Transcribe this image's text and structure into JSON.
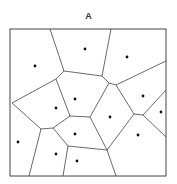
{
  "diagram": {
    "title": "A",
    "type": "voronoi",
    "frame": {
      "x": 10,
      "y": 29,
      "width": 156,
      "height": 147
    },
    "sites": [
      [
        35,
        66
      ],
      [
        85,
        49
      ],
      [
        127,
        57
      ],
      [
        75,
        99
      ],
      [
        56,
        108
      ],
      [
        143,
        96
      ],
      [
        161,
        112
      ],
      [
        110,
        117
      ],
      [
        75,
        134
      ],
      [
        138,
        135
      ],
      [
        18,
        142
      ],
      [
        56,
        154
      ],
      [
        77,
        161
      ]
    ],
    "edges": [
      [
        50,
        29,
        64,
        71
      ],
      [
        111,
        29,
        102,
        76
      ],
      [
        64,
        71,
        102,
        76
      ],
      [
        102,
        76,
        109,
        83
      ],
      [
        109,
        83,
        116,
        85
      ],
      [
        116,
        85,
        166,
        61
      ],
      [
        64,
        71,
        56,
        79
      ],
      [
        56,
        79,
        12,
        103
      ],
      [
        56,
        79,
        70,
        116
      ],
      [
        109,
        83,
        90,
        117
      ],
      [
        70,
        116,
        90,
        117
      ],
      [
        116,
        85,
        134,
        114
      ],
      [
        134,
        114,
        143,
        115
      ],
      [
        143,
        115,
        166,
        90
      ],
      [
        143,
        115,
        166,
        137
      ],
      [
        134,
        114,
        107,
        150
      ],
      [
        90,
        117,
        107,
        150
      ],
      [
        12,
        103,
        41,
        129
      ],
      [
        41,
        129,
        53,
        128
      ],
      [
        53,
        128,
        70,
        116
      ],
      [
        53,
        128,
        68,
        146
      ],
      [
        68,
        146,
        107,
        150
      ],
      [
        41,
        129,
        29,
        176
      ],
      [
        68,
        146,
        63,
        176
      ],
      [
        107,
        150,
        116,
        176
      ]
    ],
    "colors": {
      "line": "#444444",
      "dot": "#111111",
      "background": "#ffffff"
    }
  }
}
